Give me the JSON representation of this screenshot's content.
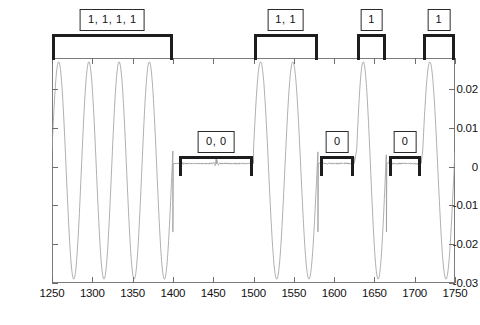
{
  "chart_data": {
    "type": "line",
    "title": "",
    "xlabel": "",
    "ylabel": "",
    "xlim": [
      1250,
      1750
    ],
    "ylim": [
      -0.03,
      0.028
    ],
    "grid": false,
    "legend": null,
    "xticks": [
      1250,
      1300,
      1350,
      1400,
      1450,
      1500,
      1550,
      1600,
      1650,
      1700,
      1750
    ],
    "xticklabels": [
      "1250",
      "1300",
      "1350",
      "1400",
      "1450",
      "1500",
      "1550",
      "1600",
      "1650",
      "1700",
      "1750"
    ],
    "yticks": [
      0.02,
      0.01,
      0,
      -0.01,
      -0.02,
      -0.03
    ],
    "yticklabels": [
      "0.02",
      "0.01",
      "0",
      "-0.01",
      "-0.02",
      "-0.03"
    ],
    "series": [
      {
        "name": "modulated-signal",
        "color": "#9a9a9a",
        "amplitude_positive": 0.027,
        "amplitude_negative": -0.029,
        "zero_level": 0.0008,
        "carrier_period": 22,
        "symbol_segments": [
          {
            "bit": "1",
            "x_start": 1250,
            "x_end": 1272,
            "state": "carrier"
          },
          {
            "bit": "1",
            "x_start": 1272,
            "x_end": 1294,
            "state": "carrier"
          },
          {
            "bit": "1",
            "x_start": 1294,
            "x_end": 1316,
            "state": "carrier"
          },
          {
            "bit": "1",
            "x_start": 1316,
            "x_end": 1338,
            "state": "carrier"
          },
          {
            "bit": "0",
            "x_start": 1338,
            "x_end": 1360,
            "state": "flat"
          },
          {
            "bit": "0",
            "x_start": 1360,
            "x_end": 1382,
            "state": "flat"
          },
          {
            "bit": "1",
            "x_start": 1382,
            "x_end": 1404,
            "state": "carrier"
          },
          {
            "bit": "1",
            "x_start": 1404,
            "x_end": 1426,
            "state": "carrier"
          },
          {
            "bit": "0",
            "x_start": 1426,
            "x_end": 1448,
            "state": "flat"
          },
          {
            "bit": "1",
            "x_start": 1448,
            "x_end": 1470,
            "state": "carrier"
          },
          {
            "bit": "0",
            "x_start": 1470,
            "x_end": 1492,
            "state": "flat"
          },
          {
            "bit": "1",
            "x_start": 1492,
            "x_end": 1514,
            "state": "carrier"
          }
        ]
      }
    ],
    "annotations": [
      {
        "id": "grp-1",
        "label": "1, 1, 1, 1",
        "bit_value": "1",
        "count": 4,
        "x_start": 1250,
        "x_end": 1400,
        "position": "top"
      },
      {
        "id": "grp-2",
        "label": "0, 0",
        "bit_value": "0",
        "count": 2,
        "x_start": 1408,
        "x_end": 1500,
        "position": "middle"
      },
      {
        "id": "grp-3",
        "label": "1, 1",
        "bit_value": "1",
        "count": 2,
        "x_start": 1500,
        "x_end": 1580,
        "position": "top"
      },
      {
        "id": "grp-4",
        "label": "0",
        "bit_value": "0",
        "count": 1,
        "x_start": 1583,
        "x_end": 1625,
        "position": "middle"
      },
      {
        "id": "grp-5",
        "label": "1",
        "bit_value": "1",
        "count": 1,
        "x_start": 1628,
        "x_end": 1665,
        "position": "top"
      },
      {
        "id": "grp-6",
        "label": "0",
        "bit_value": "0",
        "count": 1,
        "x_start": 1668,
        "x_end": 1708,
        "position": "middle"
      },
      {
        "id": "grp-7",
        "label": "1",
        "bit_value": "1",
        "count": 1,
        "x_start": 1710,
        "x_end": 1750,
        "position": "top"
      }
    ]
  },
  "axes": {
    "x_tick_labels": [
      "1250",
      "1300",
      "1350",
      "1400",
      "1450",
      "1500",
      "1550",
      "1600",
      "1650",
      "1700",
      "1750"
    ],
    "y_tick_labels": [
      "0.02",
      "0.01",
      "0",
      "-0.01",
      "-0.02",
      "-0.03"
    ]
  },
  "annotation_labels": {
    "g1": "1, 1, 1, 1",
    "g2": "0, 0",
    "g3": "1, 1",
    "g4": "0",
    "g5": "1",
    "g6": "0",
    "g7": "1"
  },
  "colors": {
    "signal": "#9a9a9a",
    "axis": "#7c7c7c",
    "annotation": "#1d1d1d",
    "background": "#ffffff"
  }
}
